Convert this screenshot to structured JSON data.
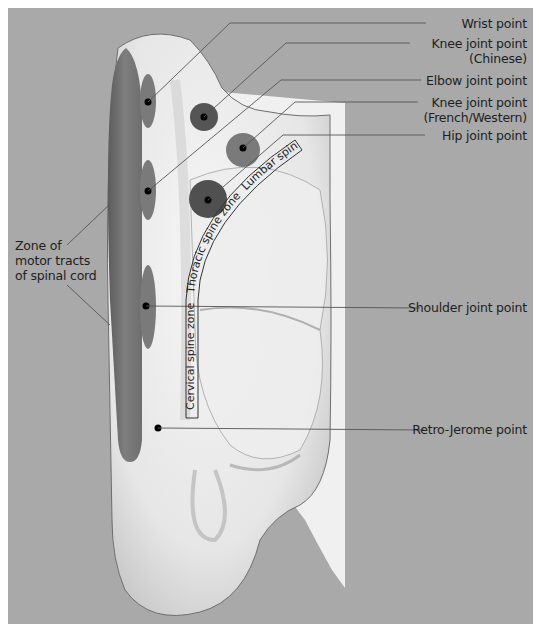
{
  "figure": {
    "background_color": "#a9a9a9",
    "zone_color": "#7c7c7c",
    "point_color": "#000000",
    "labels_right": [
      {
        "id": "wrist",
        "lines": [
          "Wrist point"
        ]
      },
      {
        "id": "knee-chinese",
        "lines": [
          "Knee joint point",
          "(Chinese)"
        ]
      },
      {
        "id": "elbow",
        "lines": [
          "Elbow joint point"
        ]
      },
      {
        "id": "knee-french",
        "lines": [
          "Knee joint point",
          "(French/Western)"
        ]
      },
      {
        "id": "hip",
        "lines": [
          "Hip joint point"
        ]
      },
      {
        "id": "shoulder",
        "lines": [
          "Shoulder joint point"
        ]
      },
      {
        "id": "retro-jerome",
        "lines": [
          "Retro-Jerome point"
        ]
      }
    ],
    "labels_left": [
      {
        "id": "motor-tracts",
        "lines": [
          "Zone of",
          "motor tracts",
          "of spinal cord"
        ]
      }
    ],
    "spine_zones": {
      "cervical": "Cervical spine zone",
      "thoracic": "Thoracic spine zone",
      "lumbar": "Lumbar spine zone"
    }
  }
}
